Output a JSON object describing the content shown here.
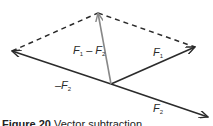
{
  "diagram": {
    "type": "vector-parallelogram",
    "vectors": [
      {
        "name": "F1",
        "label_main": "F",
        "label_sub": "1",
        "color": "#2b2b2b"
      },
      {
        "name": "F2",
        "label_main": "F",
        "label_sub": "2",
        "color": "#2b2b2b"
      },
      {
        "name": "-F2",
        "label_main": "–F",
        "label_sub": "2",
        "color": "#2b2b2b"
      },
      {
        "name": "F1-F2",
        "label_main": "F",
        "label_sub": "1",
        "label_mid": " – F",
        "label_sub2": "2",
        "color": "#888888"
      }
    ],
    "dashed_color": "#2b2b2b"
  },
  "caption": {
    "figure": "Figure 20",
    "text": "Vector subtraction"
  }
}
